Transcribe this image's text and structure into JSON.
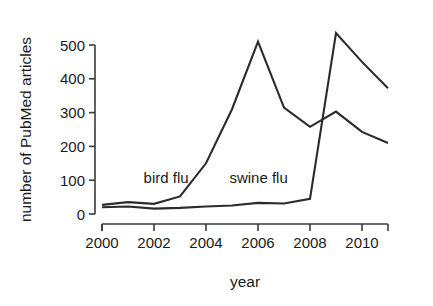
{
  "chart_data": {
    "type": "line",
    "title": "",
    "xlabel": "year",
    "ylabel": "number of PubMed articles",
    "x": [
      2000,
      2001,
      2002,
      2003,
      2004,
      2005,
      2006,
      2007,
      2008,
      2009,
      2010,
      2011
    ],
    "xlim": [
      2000,
      2011
    ],
    "ylim": [
      0,
      540
    ],
    "grid": false,
    "legend_position": "inline-annotations",
    "xticks": [
      "2000",
      "2002",
      "2004",
      "2006",
      "2008",
      "2010"
    ],
    "xtick_values": [
      2000,
      2002,
      2004,
      2006,
      2008,
      2010
    ],
    "yticks": [
      "0",
      "100",
      "200",
      "300",
      "400",
      "500"
    ],
    "ytick_values": [
      0,
      100,
      200,
      300,
      400,
      500
    ],
    "series": [
      {
        "name": "bird flu",
        "label": "bird flu",
        "color": "#2b2b2b",
        "values": [
          27,
          35,
          30,
          52,
          150,
          310,
          510,
          315,
          258,
          303,
          243,
          210
        ]
      },
      {
        "name": "swine flu",
        "label": "swine flu",
        "color": "#2b2b2b",
        "values": [
          20,
          22,
          16,
          18,
          22,
          25,
          33,
          31,
          45,
          535,
          450,
          372
        ]
      }
    ],
    "annotations": [
      {
        "text": "bird flu",
        "x": 2001.6,
        "y": 92,
        "anchor": "start"
      },
      {
        "text": "swine flu",
        "x": 2004.9,
        "y": 92,
        "anchor": "start"
      }
    ]
  }
}
